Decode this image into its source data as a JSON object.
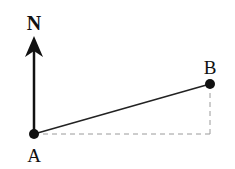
{
  "diagram": {
    "north_label": "N",
    "point_a_label": "A",
    "point_b_label": "B",
    "colors": {
      "ink": "#111111",
      "dashed": "#999999",
      "background": "#ffffff"
    }
  }
}
